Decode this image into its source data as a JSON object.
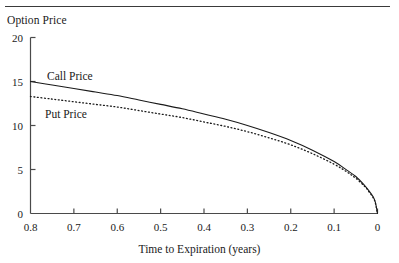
{
  "figure": {
    "top_rule": true,
    "y_axis_title": "Option Price",
    "x_axis_title": "Time to Expiration (years)",
    "series_labels": {
      "call": "Call Price",
      "put": "Put Price"
    },
    "line_color": "#1a1a1a",
    "axis_color": "#4a4a4a"
  },
  "chart_data": {
    "type": "line",
    "title": "",
    "xlabel": "Time to Expiration (years)",
    "ylabel": "Option Price",
    "xlim": [
      0.8,
      0.0
    ],
    "ylim": [
      0,
      20
    ],
    "x_reversed": true,
    "grid": false,
    "legend": "inline-annotations",
    "xticks": [
      "0.8",
      "0.7",
      "0.6",
      "0.5",
      "0.4",
      "0.3",
      "0.2",
      "0.1",
      "0"
    ],
    "xtick_values": [
      0.8,
      0.7,
      0.6,
      0.5,
      0.4,
      0.3,
      0.2,
      0.1,
      0
    ],
    "yticks": [
      "0",
      "5",
      "10",
      "15",
      "20"
    ],
    "ytick_values": [
      0,
      5,
      10,
      15,
      20
    ],
    "x": [
      0.8,
      0.75,
      0.7,
      0.65,
      0.6,
      0.55,
      0.5,
      0.45,
      0.4,
      0.35,
      0.3,
      0.25,
      0.2,
      0.15,
      0.1,
      0.07,
      0.05,
      0.03,
      0.02,
      0.01,
      0.005,
      0.0
    ],
    "series": [
      {
        "name": "Call Price",
        "style": "solid",
        "values": [
          15.0,
          14.6,
          14.2,
          13.8,
          13.4,
          12.9,
          12.4,
          11.9,
          11.3,
          10.7,
          10.0,
          9.2,
          8.3,
          7.2,
          5.9,
          4.9,
          4.2,
          3.2,
          2.6,
          1.9,
          1.3,
          0.0
        ]
      },
      {
        "name": "Put Price",
        "style": "dotted",
        "values": [
          13.3,
          13.0,
          12.7,
          12.4,
          12.1,
          11.7,
          11.3,
          10.9,
          10.4,
          9.9,
          9.3,
          8.6,
          7.8,
          6.8,
          5.6,
          4.7,
          4.0,
          3.1,
          2.5,
          1.8,
          1.2,
          0.0
        ]
      }
    ]
  }
}
